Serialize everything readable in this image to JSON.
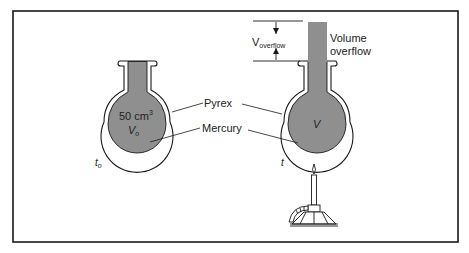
{
  "diagram": {
    "type": "thermal expansion of mercury in Pyrex flask",
    "colors": {
      "mercury": "#8f8f8f",
      "glass": "#ffffff",
      "outline": "#1a1a1a",
      "frame": "#1a1a1a"
    },
    "left_flask": {
      "volume_value": "50 cm",
      "volume_exp": "3",
      "volume_symbol": "V",
      "volume_sub": "o",
      "temp_symbol": "t",
      "temp_sub": "o"
    },
    "right_flask": {
      "volume_symbol": "V",
      "temp_symbol": "t"
    },
    "labels": {
      "pyrex": "Pyrex",
      "mercury": "Mercury",
      "overflow_symbol": "V",
      "overflow_sub": "overflow",
      "overflow_line1": "Volume",
      "overflow_line2": "overflow"
    },
    "burner_icon": "bunsen-burner-icon"
  }
}
